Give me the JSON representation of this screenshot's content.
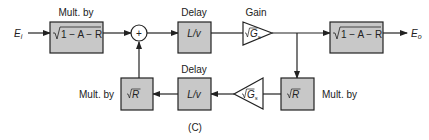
{
  "diagram": {
    "caption": "(C)",
    "input_label": "E",
    "input_sub": "i",
    "output_label": "E",
    "output_sub": "o",
    "top": {
      "mult_in": {
        "title": "Mult. by",
        "expr": "1 − A − R"
      },
      "sum": {
        "symbol": "+"
      },
      "delay": {
        "title": "Delay",
        "expr": "L/v"
      },
      "gain": {
        "title": "Gain",
        "expr": "G",
        "sub": "s"
      },
      "mult_out": {
        "expr": "1 − A − R"
      }
    },
    "bottom": {
      "mult_r_right": {
        "title": "Mult. by",
        "expr": "R"
      },
      "gain": {
        "expr": "G",
        "sub": "s"
      },
      "delay": {
        "title": "Delay",
        "expr": "L/v"
      },
      "mult_r_left": {
        "title": "Mult. by",
        "expr": "R"
      }
    },
    "colors": {
      "box_fill": "#c8c8c8",
      "stroke": "#222222"
    }
  }
}
